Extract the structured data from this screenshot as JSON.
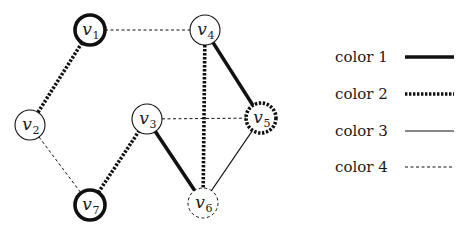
{
  "styles": {
    "color1": {
      "stroke": "#111111",
      "width": 3.6,
      "dash": ""
    },
    "color2": {
      "stroke": "#111111",
      "width": 3.6,
      "dash": "2.4 1.6"
    },
    "color3": {
      "stroke": "#111111",
      "width": 1.1,
      "dash": ""
    },
    "color4": {
      "stroke": "#111111",
      "width": 1.0,
      "dash": "3 2.5"
    }
  },
  "nodes": [
    {
      "id": "v1",
      "base": "v",
      "sub": "1",
      "x": 90,
      "y": 30,
      "style": "color1"
    },
    {
      "id": "v2",
      "base": "v",
      "sub": "2",
      "x": 30,
      "y": 125,
      "style": "color3"
    },
    {
      "id": "v3",
      "base": "v",
      "sub": "3",
      "x": 147,
      "y": 119,
      "style": "color3"
    },
    {
      "id": "v4",
      "base": "v",
      "sub": "4",
      "x": 205,
      "y": 30,
      "style": "color3"
    },
    {
      "id": "v5",
      "base": "v",
      "sub": "5",
      "x": 261,
      "y": 118,
      "style": "color2"
    },
    {
      "id": "v6",
      "base": "v",
      "sub": "6",
      "x": 203,
      "y": 203,
      "style": "color4"
    },
    {
      "id": "v7",
      "base": "v",
      "sub": "7",
      "x": 90,
      "y": 205,
      "style": "color1"
    }
  ],
  "edges": [
    {
      "from": "v1",
      "to": "v4",
      "style": "color4"
    },
    {
      "from": "v1",
      "to": "v2",
      "style": "color2"
    },
    {
      "from": "v2",
      "to": "v7",
      "style": "color4"
    },
    {
      "from": "v7",
      "to": "v3",
      "style": "color2"
    },
    {
      "from": "v3",
      "to": "v5",
      "style": "color4"
    },
    {
      "from": "v3",
      "to": "v6",
      "style": "color1"
    },
    {
      "from": "v4",
      "to": "v6",
      "style": "color2"
    },
    {
      "from": "v4",
      "to": "v5",
      "style": "color1"
    },
    {
      "from": "v5",
      "to": "v6",
      "style": "color3"
    }
  ],
  "node_radius": 15,
  "legend": {
    "items": [
      {
        "label": "color 1",
        "style": "color1",
        "y": 57
      },
      {
        "label": "color 2",
        "style": "color2",
        "y": 94
      },
      {
        "label": "color 3",
        "style": "color3",
        "y": 131
      },
      {
        "label": "color 4",
        "style": "color4",
        "y": 167
      }
    ],
    "label_x": 335,
    "line_x1": 405,
    "line_x2": 454
  }
}
